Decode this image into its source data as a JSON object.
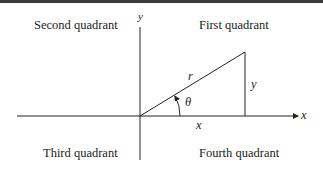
{
  "diagram": {
    "quadrants": {
      "second": "Second quadrant",
      "first": "First quadrant",
      "third": "Third quadrant",
      "fourth": "Fourth quadrant"
    },
    "axes": {
      "x_label": "x",
      "y_label": "y"
    },
    "triangle": {
      "hypotenuse_label": "r",
      "opposite_label": "y",
      "adjacent_label": "x",
      "angle_label": "θ"
    },
    "colors": {
      "line": "#222222",
      "topbar": "#3a3a3a"
    }
  }
}
